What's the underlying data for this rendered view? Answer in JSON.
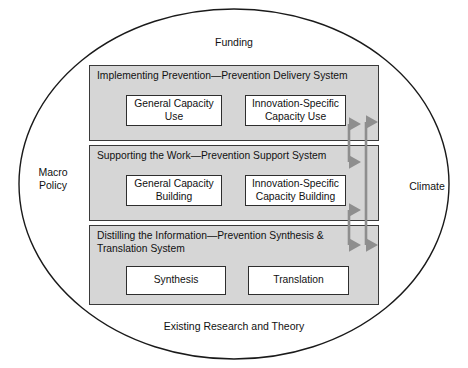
{
  "diagram": {
    "context_labels": {
      "top": "Funding",
      "bottom": "Existing Research and Theory",
      "left": "Macro\nPolicy",
      "right": "Climate"
    },
    "panels": [
      {
        "id": "prevention-delivery-system",
        "title": "Implementing Prevention—Prevention Delivery System",
        "boxes": [
          {
            "id": "general-capacity-use",
            "label": "General Capacity\nUse"
          },
          {
            "id": "innovation-specific-capacity-use",
            "label": "Innovation-Specific\nCapacity Use"
          }
        ]
      },
      {
        "id": "prevention-support-system",
        "title": "Supporting the Work—Prevention Support System",
        "boxes": [
          {
            "id": "general-capacity-building",
            "label": "General Capacity\nBuilding"
          },
          {
            "id": "innovation-specific-capacity-building",
            "label": "Innovation-Specific\nCapacity Building"
          }
        ]
      },
      {
        "id": "prevention-synthesis-translation-system",
        "title": "Distilling the Information—Prevention Synthesis &\nTranslation System",
        "boxes": [
          {
            "id": "synthesis",
            "label": "Synthesis"
          },
          {
            "id": "translation",
            "label": "Translation"
          }
        ]
      }
    ],
    "connectors": [
      {
        "id": "delivery-support-arrow",
        "kind": "double-headed-vertical-arrow"
      },
      {
        "id": "support-synthesis-arrow",
        "kind": "double-headed-vertical-arrow"
      },
      {
        "id": "delivery-synthesis-arrow",
        "kind": "double-headed-vertical-arrow-long"
      }
    ],
    "colors": {
      "panel_fill": "#d6d6d6",
      "panel_border": "#3a3a3a",
      "box_fill": "#ffffff",
      "box_border": "#2e2e2e",
      "arrow": "#8e8e8e",
      "ellipse_border": "#1a1a1a",
      "background": "#ffffff"
    }
  }
}
